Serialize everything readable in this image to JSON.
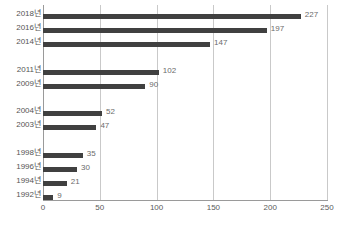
{
  "chart_data": {
    "type": "bar",
    "orientation": "horizontal",
    "title": "",
    "subtitle": "",
    "xlabel": "",
    "ylabel": "",
    "categories": [
      "2018년",
      "2016년",
      "2014년",
      "2011년",
      "2009년",
      "2004년",
      "2003년",
      "1998년",
      "1996년",
      "1994년",
      "1992년"
    ],
    "values": [
      227,
      197,
      147,
      102,
      90,
      52,
      47,
      35,
      30,
      21,
      9
    ],
    "xlim": [
      0,
      250
    ],
    "xticks": [
      0,
      50,
      100,
      150,
      200,
      250
    ],
    "xtick_labels": [
      "0",
      "50",
      "100",
      "150",
      "200",
      "250"
    ],
    "grid": true,
    "grid_axis": "x",
    "legend": false,
    "data_labels": true,
    "bars": [
      {
        "category": "2018년",
        "value": 227,
        "label": "227",
        "row": 0
      },
      {
        "category": "2016년",
        "value": 197,
        "label": "197",
        "row": 1
      },
      {
        "category": "2014년",
        "value": 147,
        "label": "147",
        "row": 2
      },
      {
        "category": "2011년",
        "value": 102,
        "label": "102",
        "row": 4
      },
      {
        "category": "2009년",
        "value": 90,
        "label": "90",
        "row": 5
      },
      {
        "category": "2004년",
        "value": 52,
        "label": "52",
        "row": 7
      },
      {
        "category": "2003년",
        "value": 47,
        "label": "47",
        "row": 8
      },
      {
        "category": "1998년",
        "value": 35,
        "label": "35",
        "row": 10
      },
      {
        "category": "1996년",
        "value": 30,
        "label": "30",
        "row": 11
      },
      {
        "category": "1994년",
        "value": 21,
        "label": "21",
        "row": 12
      },
      {
        "category": "1992년",
        "value": 9,
        "label": "9",
        "row": 13
      }
    ]
  },
  "style": {
    "bar_color": "#404040",
    "grid_color": "#c9c9c9",
    "axis_color": "#9a9a9a",
    "label_color": "#555555",
    "value_color": "#6b6b6b",
    "background": "#ffffff"
  }
}
